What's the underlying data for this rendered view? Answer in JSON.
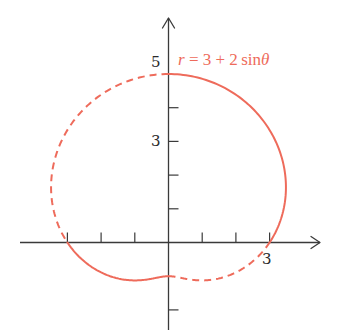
{
  "chart_data": {
    "type": "line",
    "subtype": "polar-curve",
    "title": "",
    "equation": "r = 3 + 2 sin θ",
    "equation_parts": {
      "r": "r",
      "eq": " = 3 + 2 sin",
      "theta": "θ"
    },
    "function": {
      "a": 3,
      "b": 2,
      "trig": "sin"
    },
    "xlabel": "",
    "ylabel": "",
    "xlim": [
      -4.5,
      4.5
    ],
    "ylim": [
      -2.6,
      6.7
    ],
    "x_ticks": [
      -3,
      -2,
      -1,
      1,
      2,
      3
    ],
    "y_ticks": [
      -2,
      1,
      2,
      3,
      4
    ],
    "tick_labels": [
      {
        "axis": "x",
        "value": 3,
        "text": "3"
      },
      {
        "axis": "y",
        "value": 3,
        "text": "3"
      },
      {
        "axis": "y",
        "value": 5,
        "text": "5"
      }
    ],
    "segments": [
      {
        "theta_start_deg": 0,
        "theta_end_deg": 90,
        "style": "solid"
      },
      {
        "theta_start_deg": 90,
        "theta_end_deg": 180,
        "style": "dashed"
      },
      {
        "theta_start_deg": 180,
        "theta_end_deg": 270,
        "style": "solid"
      },
      {
        "theta_start_deg": 270,
        "theta_end_deg": 360,
        "style": "dashed"
      }
    ],
    "key_points": [
      {
        "theta_deg": 0,
        "r": 3,
        "x": 3,
        "y": 0
      },
      {
        "theta_deg": 90,
        "r": 5,
        "x": 0,
        "y": 5
      },
      {
        "theta_deg": 180,
        "r": 3,
        "x": -3,
        "y": 0
      },
      {
        "theta_deg": 270,
        "r": 1,
        "x": 0,
        "y": -1
      }
    ],
    "grid": false,
    "legend": "none",
    "colors": {
      "curve": "#ee6b5b",
      "axes": "#3a3a3a",
      "label": "#ee6b5b"
    }
  }
}
